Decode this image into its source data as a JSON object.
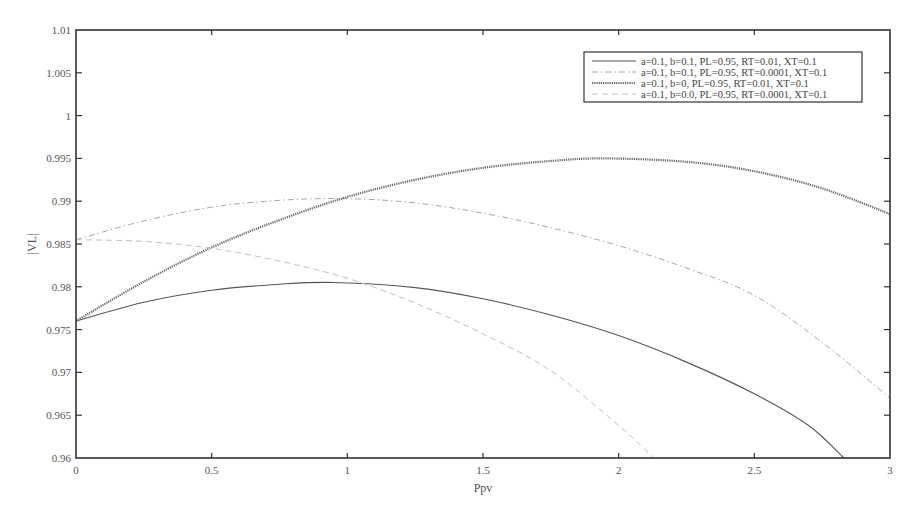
{
  "chart_data": {
    "type": "line",
    "title": "",
    "xlabel": "Ppv",
    "ylabel": "|VL|",
    "xlim": [
      0,
      3
    ],
    "ylim": [
      0.96,
      1.01
    ],
    "xticks": [
      0,
      0.5,
      1,
      1.5,
      2,
      2.5,
      3
    ],
    "xtick_labels": [
      "0",
      "0.5",
      "1",
      "1.5",
      "2",
      "2.5",
      "3"
    ],
    "yticks": [
      0.96,
      0.965,
      0.97,
      0.975,
      0.98,
      0.985,
      0.99,
      0.995,
      1,
      1.005,
      1.01
    ],
    "ytick_labels": [
      "0.96",
      "0.965",
      "0.97",
      "0.975",
      "0.98",
      "0.985",
      "0.99",
      "0.995",
      "1",
      "1.005",
      "1.01"
    ],
    "grid": false,
    "legend_position": "upper right",
    "series": [
      {
        "name": "a=0.1, b=0.1, PL=0.95, RT=0.01, XT=0.1",
        "style": "solid",
        "color": "#555555",
        "width": 1.1,
        "x": [
          0,
          0.25,
          0.5,
          0.75,
          0.95,
          1.25,
          1.5,
          1.75,
          2,
          2.25,
          2.5,
          2.7,
          2.83
        ],
        "values": [
          0.976,
          0.9782,
          0.9796,
          0.9803,
          0.9805,
          0.9799,
          0.9786,
          0.9767,
          0.9743,
          0.9712,
          0.9675,
          0.9638,
          0.96
        ]
      },
      {
        "name": "a=0.1, b=0.1, PL=0.95, RT=0.0001, XT=0.1",
        "style": "dashdot",
        "color": "#a8a8a8",
        "width": 1,
        "x": [
          0,
          0.25,
          0.5,
          0.75,
          1,
          1.25,
          1.5,
          1.75,
          2,
          2.25,
          2.5,
          2.75,
          3
        ],
        "values": [
          0.9855,
          0.9877,
          0.9893,
          0.9901,
          0.9903,
          0.9898,
          0.9886,
          0.9869,
          0.9848,
          0.9822,
          0.979,
          0.9735,
          0.967
        ]
      },
      {
        "name": "a=0.1, b=0, PL=0.95, RT=0.01, XT=0.1",
        "style": "dotted",
        "color": "#666666",
        "width": 2.2,
        "x": [
          0,
          0.25,
          0.5,
          0.75,
          1,
          1.25,
          1.5,
          1.75,
          1.95,
          2.25,
          2.5,
          2.75,
          3
        ],
        "values": [
          0.976,
          0.9806,
          0.9846,
          0.9878,
          0.9905,
          0.9925,
          0.9939,
          0.9947,
          0.995,
          0.9946,
          0.9935,
          0.9915,
          0.9885
        ]
      },
      {
        "name": "a=0.1, b=0.0, PL=0.95, RT=0.0001, XT=0.1",
        "style": "dashed",
        "color": "#c0c0c0",
        "width": 1,
        "x": [
          0,
          0.25,
          0.5,
          0.75,
          1,
          1.25,
          1.5,
          1.75,
          2,
          2.13
        ],
        "values": [
          0.9855,
          0.9853,
          0.9845,
          0.983,
          0.981,
          0.9781,
          0.9745,
          0.9702,
          0.9638,
          0.96
        ]
      }
    ]
  },
  "legend": {
    "items": [
      {
        "label": "a=0.1, b=0.1, PL=0.95, RT=0.01, XT=0.1"
      },
      {
        "label": "a=0.1, b=0.1, PL=0.95, RT=0.0001, XT=0.1"
      },
      {
        "label": "a=0.1, b=0, PL=0.95, RT=0.01, XT=0.1"
      },
      {
        "label": "a=0.1, b=0.0, PL=0.95, RT=0.0001, XT=0.1"
      }
    ]
  },
  "axes": {
    "xlabel": "Ppv",
    "ylabel": "|VL|"
  }
}
